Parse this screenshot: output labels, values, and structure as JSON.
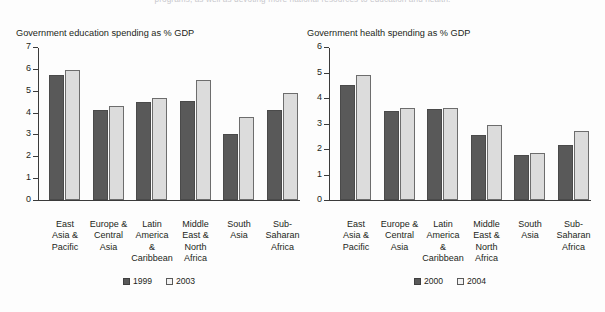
{
  "page": {
    "top_caption": "programs, as well as devoting more national resources to education and health."
  },
  "colors": {
    "series_1": "#595959",
    "series_2": "#dcdcdc",
    "axis": "#3b3b3b",
    "text": "#231f20",
    "background": "#fdfdfd"
  },
  "chart_data": [
    {
      "type": "bar",
      "title": "Government education spending as % GDP",
      "xlabel": "",
      "ylabel": "",
      "ylim": [
        0,
        7
      ],
      "yticks": [
        0,
        1,
        2,
        3,
        4,
        5,
        6,
        7
      ],
      "grid": false,
      "legend_position": "bottom",
      "categories": [
        "East Asia & Pacific",
        "Europe & Central Asia",
        "Latin America & Caribbean",
        "Middle East & North Africa",
        "South Asia",
        "Sub-Saharan Africa"
      ],
      "category_lines": [
        [
          "East",
          "Asia &",
          "Pacific"
        ],
        [
          "Europe &",
          "Central",
          "Asia"
        ],
        [
          "Latin",
          "America",
          "&",
          "Caribbean"
        ],
        [
          "Middle",
          "East &",
          "North",
          "Africa"
        ],
        [
          "South",
          "Asia"
        ],
        [
          "Sub-",
          "Saharan",
          "Africa"
        ]
      ],
      "series": [
        {
          "name": "1999",
          "values": [
            5.7,
            4.1,
            4.5,
            4.55,
            3.0,
            4.1
          ]
        },
        {
          "name": "2003",
          "values": [
            5.95,
            4.3,
            4.65,
            5.5,
            3.8,
            4.9
          ]
        }
      ]
    },
    {
      "type": "bar",
      "title": "Government health spending as % GDP",
      "xlabel": "",
      "ylabel": "",
      "ylim": [
        0,
        6
      ],
      "yticks": [
        0,
        1,
        2,
        3,
        4,
        5,
        6
      ],
      "grid": false,
      "legend_position": "bottom",
      "categories": [
        "East Asia & Pacific",
        "Europe & Central Asia",
        "Latin America & Caribbean",
        "Middle East & North Africa",
        "South Asia",
        "Sub-Saharan Africa"
      ],
      "category_lines": [
        [
          "East",
          "Asia &",
          "Pacific"
        ],
        [
          "Europe &",
          "Central",
          "Asia"
        ],
        [
          "Latin",
          "America",
          "&",
          "Caribbean"
        ],
        [
          "Middle",
          "East &",
          "North",
          "Africa"
        ],
        [
          "South",
          "Asia"
        ],
        [
          "Sub-",
          "Saharan",
          "Africa"
        ]
      ],
      "series": [
        {
          "name": "2000",
          "values": [
            4.5,
            3.5,
            3.55,
            2.55,
            1.75,
            2.15
          ]
        },
        {
          "name": "2004",
          "values": [
            4.9,
            3.6,
            3.6,
            2.95,
            1.85,
            2.7
          ]
        }
      ]
    }
  ]
}
